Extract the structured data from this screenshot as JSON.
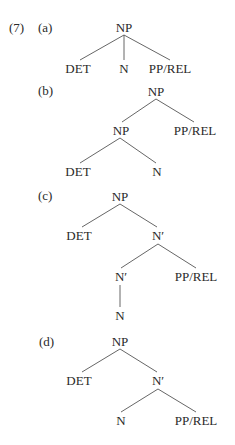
{
  "example": {
    "number": "(7)",
    "trees": [
      {
        "label": "(a)",
        "nodes": {
          "root": "NP",
          "det": "DET",
          "n": "N",
          "pp": "PP/REL"
        }
      },
      {
        "label": "(b)",
        "nodes": {
          "root": "NP",
          "inner_np": "NP",
          "pp": "PP/REL",
          "det": "DET",
          "n": "N"
        }
      },
      {
        "label": "(c)",
        "nodes": {
          "root": "NP",
          "det": "DET",
          "nbar": "N′",
          "inner_nbar": "N′",
          "pp": "PP/REL",
          "n": "N"
        }
      },
      {
        "label": "(d)",
        "nodes": {
          "root": "NP",
          "det": "DET",
          "nbar": "N′",
          "n": "N",
          "pp": "PP/REL"
        }
      }
    ]
  }
}
